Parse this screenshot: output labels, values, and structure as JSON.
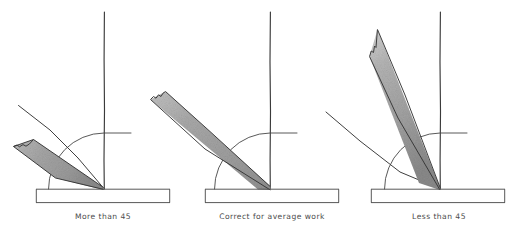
{
  "figure": {
    "background_color": "#ffffff",
    "width": 511,
    "height": 229
  },
  "style": {
    "line_color": "#3c3c3c",
    "blade_fill_light": "#cccccc",
    "blade_fill_mid": "#a9a9a9",
    "blade_fill_dark": "#8e8e8e",
    "caption_color": "#4b4b4b",
    "bar_color": "#4e4e4e"
  },
  "panels": [
    {
      "id": "panel-more-than-45",
      "caption": "More than 45",
      "angle_label": "More than 45",
      "blade_angle_degrees": 25,
      "guide_line_angle_degrees": 38,
      "pivot": {
        "x": 104,
        "y": 189
      },
      "vertical_line": {
        "x": 104,
        "y_top": 12,
        "y_bottom": 189
      },
      "arc_radius": 56,
      "base_bar": {
        "x": 36,
        "y": 189,
        "width": 134,
        "height": 14
      }
    },
    {
      "id": "panel-correct-for-average-work",
      "caption": "Correct for average work",
      "angle_label": "Correct for average work",
      "blade_angle_degrees": 45,
      "guide_line_angle_degrees": 45,
      "pivot": {
        "x": 270,
        "y": 189
      },
      "vertical_line": {
        "x": 270,
        "y_top": 12,
        "y_bottom": 189
      },
      "arc_radius": 56,
      "base_bar": {
        "x": 205,
        "y": 189,
        "width": 134,
        "height": 14
      }
    },
    {
      "id": "panel-less-than-45",
      "caption": "Less than 45",
      "angle_label": "Less than 45",
      "blade_angle_degrees": 68,
      "guide_line_angle_degrees": 40,
      "pivot": {
        "x": 440,
        "y": 189
      },
      "vertical_line": {
        "x": 440,
        "y_top": 12,
        "y_bottom": 189
      },
      "arc_radius": 56,
      "base_bar": {
        "x": 371,
        "y": 189,
        "width": 134,
        "height": 14
      }
    }
  ],
  "captions": {
    "panel1": "More than 45",
    "panel2": "Correct for average work",
    "panel3": "Less than 45"
  }
}
